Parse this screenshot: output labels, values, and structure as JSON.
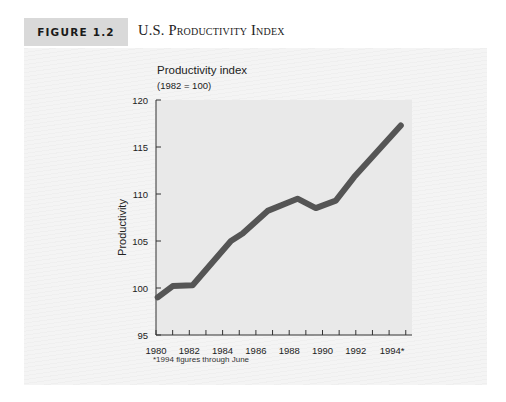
{
  "figure": {
    "label": "FIGURE 1.2",
    "title": "U.S. Productivity Index"
  },
  "chart_data": {
    "type": "line",
    "title": "U.S. Productivity Index",
    "subtitle": "Productivity index (1982 = 100)",
    "unit_title": "Productivity index",
    "unit_subtitle": "(1982 = 100)",
    "xlabel": "",
    "ylabel": "Productivity",
    "xlim": [
      1980,
      1995
    ],
    "ylim": [
      95,
      120
    ],
    "yticks": [
      95,
      100,
      105,
      110,
      115,
      120
    ],
    "xtick_labels": [
      "1980",
      "1982",
      "1984",
      "1986",
      "1988",
      "1990",
      "1992",
      "1994*"
    ],
    "xtick_values": [
      1980,
      1982,
      1984,
      1986,
      1988,
      1990,
      1992,
      1994
    ],
    "minor_xticks": [
      1981,
      1983,
      1985,
      1987,
      1989,
      1991,
      1993,
      1995
    ],
    "grid": false,
    "legend": null,
    "series": [
      {
        "name": "Productivity index",
        "color": "#555555",
        "x": [
          1980.1,
          1981.0,
          1982.2,
          1984.5,
          1985.2,
          1986.7,
          1988.5,
          1989.6,
          1990.8,
          1991.9,
          1994.7
        ],
        "values": [
          99.0,
          100.2,
          100.3,
          105.0,
          105.8,
          108.2,
          109.5,
          108.5,
          109.3,
          111.8,
          117.3
        ]
      }
    ],
    "annotations": [
      "*1994 figures through June"
    ]
  },
  "footnote": "*1994 figures through June",
  "colors": {
    "plot_background": "#e9e9e9",
    "line": "#555555",
    "axis": "#333333",
    "label_box": "#d9d9d9"
  }
}
